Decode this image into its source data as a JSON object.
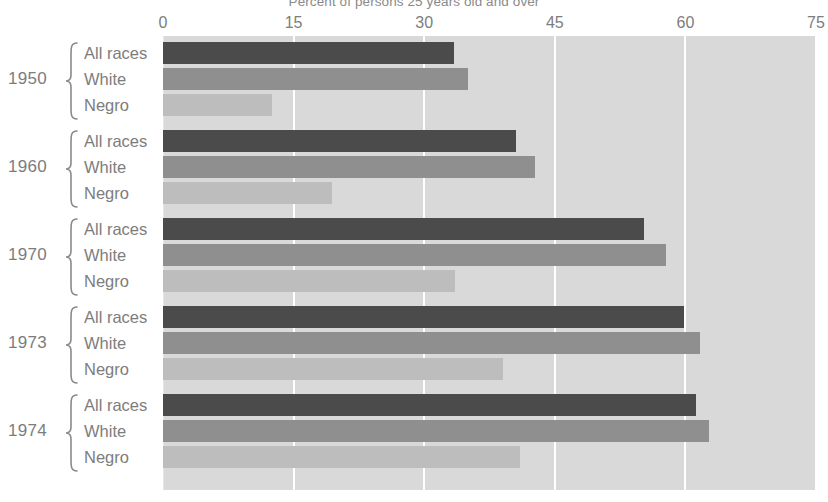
{
  "chart": {
    "title": "Percent of persons 25 years old and over"
  },
  "axis": {
    "ticks": [
      {
        "value": 0,
        "label": "0"
      },
      {
        "value": 15,
        "label": "15"
      },
      {
        "value": 30,
        "label": "30"
      },
      {
        "value": 45,
        "label": "45"
      },
      {
        "value": 60,
        "label": "60"
      },
      {
        "value": 75,
        "label": "75"
      }
    ]
  },
  "series_names": [
    "All races",
    "White",
    "Negro"
  ],
  "groups": [
    {
      "year": "1950",
      "labels": [
        "All races",
        "White",
        "Negro"
      ]
    },
    {
      "year": "1960",
      "labels": [
        "All races",
        "White",
        "Negro"
      ]
    },
    {
      "year": "1970",
      "labels": [
        "All races",
        "White",
        "Negro"
      ]
    },
    {
      "year": "1973",
      "labels": [
        "All races",
        "White",
        "Negro"
      ]
    },
    {
      "year": "1974",
      "labels": [
        "All races",
        "White",
        "Negro"
      ]
    }
  ],
  "colors": {
    "all_races": "#4b4b4b",
    "white": "#8f8f8f",
    "negro": "#bdbdbd",
    "plot_background": "#d9d9d9",
    "gridline": "#ffffff",
    "text": "#7d7d7d"
  },
  "chart_data": {
    "type": "bar",
    "orientation": "horizontal",
    "title": "Percent of persons 25 years old and over",
    "xlabel": "Percent of persons 25 years old and over",
    "ylabel": "",
    "xlim": [
      0,
      75
    ],
    "xticks": [
      0,
      15,
      30,
      45,
      60,
      75
    ],
    "grid": true,
    "legend": "none",
    "categories": [
      "1950",
      "1960",
      "1970",
      "1973",
      "1974"
    ],
    "series": [
      {
        "name": "All races",
        "color": "#4b4b4b",
        "values": [
          33.4,
          40.5,
          55.2,
          59.8,
          61.2
        ]
      },
      {
        "name": "White",
        "color": "#8f8f8f",
        "values": [
          35.0,
          42.7,
          57.8,
          61.7,
          62.7
        ]
      },
      {
        "name": "Negro",
        "color": "#bdbdbd",
        "values": [
          12.5,
          19.4,
          33.5,
          39.0,
          41.0
        ]
      }
    ]
  }
}
